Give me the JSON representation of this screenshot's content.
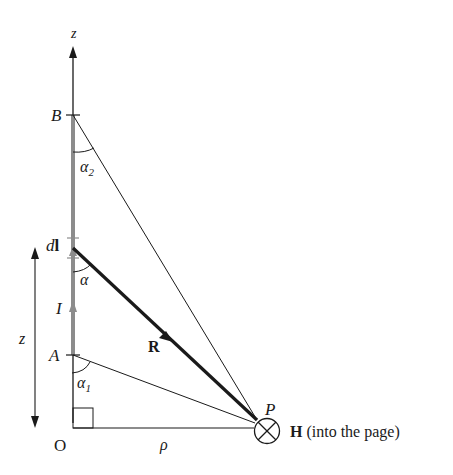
{
  "labels": {
    "z_axis": "z",
    "B": "B",
    "alpha2": "α",
    "alpha2_sub": "2",
    "dl_d": "d",
    "dl_l": "l",
    "alpha": "α",
    "I": "I",
    "R": "R",
    "A": "A",
    "alpha1": "α",
    "alpha1_sub": "1",
    "z_dist": "z",
    "O": "O",
    "rho": "ρ",
    "P": "P",
    "H": "H",
    "H_note": " (into the page)"
  },
  "colors": {
    "line": "#1a1a1a",
    "conductor": "#8c8c8c"
  }
}
